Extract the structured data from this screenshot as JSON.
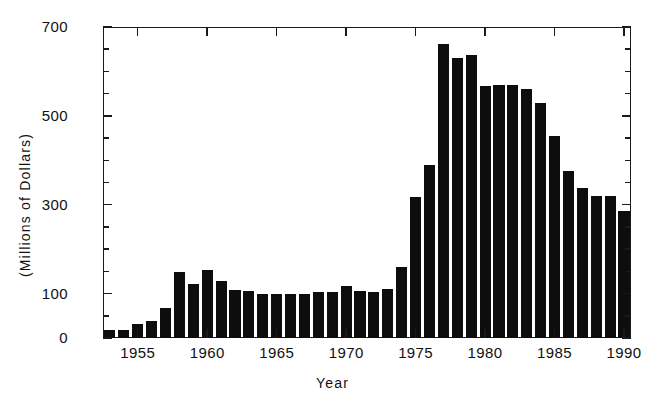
{
  "chart_data": {
    "type": "bar",
    "title": "",
    "xlabel": "Year",
    "ylabel": "(Millions of Dollars)",
    "xlim": [
      1952.5,
      1990.5
    ],
    "ylim": [
      0,
      700
    ],
    "grid": false,
    "legend": null,
    "y_ticks": [
      0,
      100,
      300,
      500,
      700
    ],
    "y_tick_labels": [
      "0",
      "100",
      "300",
      "500",
      "700"
    ],
    "y_minor_ticks": [
      50,
      150,
      200,
      250,
      350,
      400,
      450,
      550,
      600,
      650
    ],
    "x_ticks": [
      1955,
      1960,
      1965,
      1970,
      1975,
      1980,
      1985,
      1990
    ],
    "x_tick_labels": [
      "1955",
      "1960",
      "1965",
      "1970",
      "1975",
      "1980",
      "1985",
      "1990"
    ],
    "bar_color": "#0d0d0d",
    "categories": [
      "1953",
      "1954",
      "1955",
      "1956",
      "1957",
      "1958",
      "1959",
      "1960",
      "1961",
      "1962",
      "1963",
      "1964",
      "1965",
      "1966",
      "1967",
      "1968",
      "1969",
      "1970",
      "1971",
      "1972",
      "1973",
      "1974",
      "1975",
      "1976",
      "1977",
      "1978",
      "1979",
      "1980",
      "1981",
      "1982",
      "1983",
      "1984",
      "1985",
      "1986",
      "1987",
      "1988",
      "1989",
      "1990"
    ],
    "values": [
      18,
      18,
      32,
      38,
      68,
      148,
      122,
      152,
      128,
      108,
      105,
      100,
      98,
      100,
      100,
      104,
      104,
      118,
      106,
      104,
      110,
      160,
      318,
      390,
      662,
      630,
      638,
      568,
      570,
      570,
      560,
      530,
      455,
      375,
      338,
      320,
      320,
      285
    ]
  }
}
